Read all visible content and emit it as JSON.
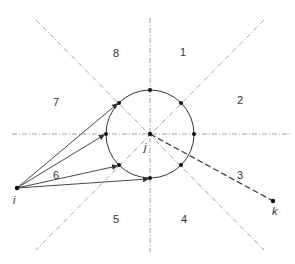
{
  "diagram": {
    "center": {
      "label": "j",
      "x": 150,
      "y": 134
    },
    "circle_radius": 44,
    "source_point": {
      "label": "i",
      "x": 17,
      "y": 188
    },
    "target_point": {
      "label": "k",
      "x": 273,
      "y": 201
    },
    "regions": [
      {
        "label": "1",
        "x": 183,
        "y": 53
      },
      {
        "label": "2",
        "x": 240,
        "y": 101
      },
      {
        "label": "3",
        "x": 240,
        "y": 176
      },
      {
        "label": "4",
        "x": 184,
        "y": 220
      },
      {
        "label": "5",
        "x": 116,
        "y": 220
      },
      {
        "label": "6",
        "x": 56,
        "y": 176
      },
      {
        "label": "7",
        "x": 56,
        "y": 103
      },
      {
        "label": "8",
        "x": 116,
        "y": 54
      }
    ],
    "colors": {
      "line": "#333333",
      "axis": "#888888",
      "background": "#ffffff"
    }
  }
}
